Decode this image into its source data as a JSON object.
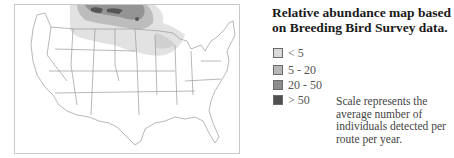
{
  "title": "Relative abundance map based on Breeding Bird Survey data.",
  "legend": {
    "items": [
      {
        "label": "< 5",
        "color": "#d9d9d9"
      },
      {
        "label": "5 - 20",
        "color": "#b7b7b7"
      },
      {
        "label": "20 - 50",
        "color": "#8c8c8c"
      },
      {
        "label": "> 50",
        "color": "#505050"
      }
    ]
  },
  "note": "Scale represents the average number of individuals detected per route per year.",
  "map": {
    "region": "Contiguous United States",
    "border_color": "#c9c9c9",
    "state_line_color": "#9a9a9a"
  }
}
